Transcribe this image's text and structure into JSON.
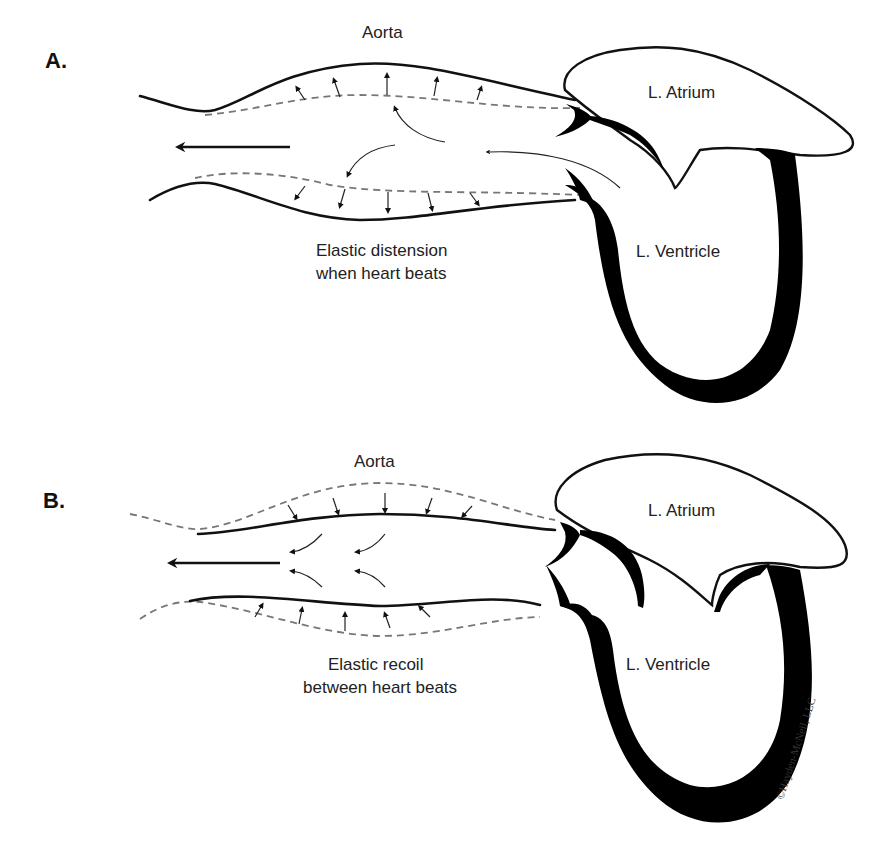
{
  "panels": [
    {
      "id": "A",
      "label": "A.",
      "aorta_label": "Aorta",
      "atrium_label": "L. Atrium",
      "ventricle_label": "L. Ventricle",
      "caption_line1": "Elastic distension",
      "caption_line2": "when heart beats"
    },
    {
      "id": "B",
      "label": "B.",
      "aorta_label": "Aorta",
      "atrium_label": "L. Atrium",
      "ventricle_label": "L. Ventricle",
      "caption_line1": "Elastic recoil",
      "caption_line2": "between heart beats"
    }
  ],
  "copyright": "©Hayden-McNeil, LLC",
  "colors": {
    "ink": "#111111",
    "dashed_wall": "#777777",
    "background": "#ffffff"
  }
}
